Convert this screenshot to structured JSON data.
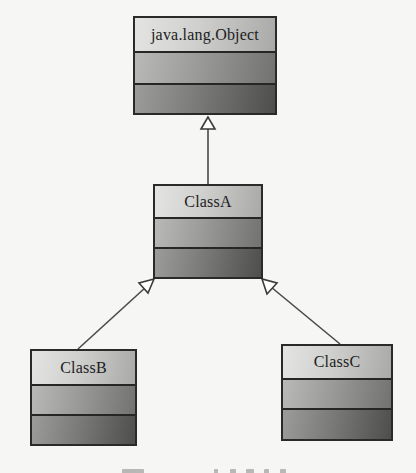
{
  "diagram": {
    "type": "uml-class-inheritance",
    "classes": [
      {
        "id": "object",
        "name": "java.lang.Object",
        "attributes": [],
        "operations": []
      },
      {
        "id": "classA",
        "name": "ClassA",
        "attributes": [],
        "operations": []
      },
      {
        "id": "classB",
        "name": "ClassB",
        "attributes": [],
        "operations": []
      },
      {
        "id": "classC",
        "name": "ClassC",
        "attributes": [],
        "operations": []
      }
    ],
    "relationships": [
      {
        "type": "generalization",
        "from": "ClassA",
        "to": "java.lang.Object"
      },
      {
        "type": "generalization",
        "from": "ClassB",
        "to": "ClassA"
      },
      {
        "type": "generalization",
        "from": "ClassC",
        "to": "ClassA"
      }
    ],
    "colors": {
      "border": "#2a2a2a",
      "edge": "#4a4a4a",
      "background": "#f6f6f4",
      "gradient_light": "#e4e4e2",
      "gradient_dark": "#4e4e4c"
    }
  }
}
